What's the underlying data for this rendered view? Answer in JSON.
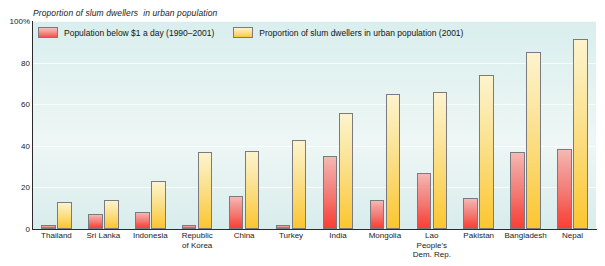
{
  "chart_data": {
    "type": "bar",
    "title": "Proportion of slum dwellers  in urban population",
    "xlabel": "",
    "ylabel": "",
    "ylim": [
      0,
      100
    ],
    "yticks": [
      {
        "value": 100,
        "label": "100%"
      },
      {
        "value": 80,
        "label": "80"
      },
      {
        "value": 60,
        "label": "60"
      },
      {
        "value": 40,
        "label": "40"
      },
      {
        "value": 20,
        "label": "20"
      },
      {
        "value": 0,
        "label": "0"
      }
    ],
    "grid": true,
    "legend_position": "top-inside",
    "categories": [
      "Thailand",
      "Sri Lanka",
      "Indonesia",
      "Republic\nof Korea",
      "China",
      "Turkey",
      "India",
      "Mongolia",
      "Lao\nPeople's\nDem. Rep.",
      "Pakistan",
      "Bangladesh",
      "Nepal"
    ],
    "series": [
      {
        "name": "Population below $1 a day (1990–2001)",
        "color": "#f5736b",
        "values": [
          2,
          7,
          8,
          2,
          16,
          2,
          35,
          14,
          27,
          15,
          37,
          38.5
        ]
      },
      {
        "name": "Proportion of slum dwellers in urban population (2001)",
        "color": "#fbd35e",
        "values": [
          13,
          14,
          23,
          37,
          37.5,
          43,
          56,
          65,
          66,
          74,
          85,
          91.5
        ]
      }
    ]
  },
  "legend": {
    "items": [
      {
        "label": "Population below $1 a day (1990–2001)",
        "swatch": "red"
      },
      {
        "label": "Proportion of slum dwellers in urban population (2001)",
        "swatch": "yellow"
      }
    ]
  }
}
